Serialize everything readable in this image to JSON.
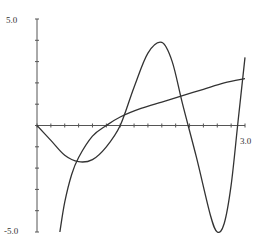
{
  "chart_data": {
    "type": "line",
    "title": "",
    "xlabel": "",
    "ylabel": "",
    "xlim": [
      0,
      3.0
    ],
    "ylim": [
      -5.0,
      5.0
    ],
    "x_tick_step": 0.2,
    "y_tick_step": 1.0,
    "axis_labels": {
      "y_max": "5.0",
      "y_min": "-5.0",
      "x_max": "3.0"
    },
    "grid": false,
    "legend": null,
    "series": [
      {
        "name": "log-curve",
        "x": [
          0.33,
          0.4,
          0.5,
          0.6,
          0.8,
          1.0,
          1.2,
          1.5,
          1.8,
          2.1,
          2.4,
          2.7,
          3.0
        ],
        "y": [
          -5.0,
          -3.6,
          -2.3,
          -1.5,
          -0.5,
          0.0,
          0.4,
          0.8,
          1.1,
          1.4,
          1.7,
          2.0,
          2.2
        ]
      },
      {
        "name": "oscillating-curve",
        "x": [
          0.0,
          0.2,
          0.4,
          0.6,
          0.8,
          1.0,
          1.2,
          1.4,
          1.6,
          1.8,
          1.95,
          2.1,
          2.3,
          2.5,
          2.6,
          2.7,
          2.8,
          2.9,
          3.0
        ],
        "y": [
          0.0,
          -0.7,
          -1.4,
          -1.7,
          -1.6,
          -1.0,
          0.0,
          1.8,
          3.4,
          3.9,
          3.0,
          1.0,
          -1.5,
          -4.2,
          -5.0,
          -4.6,
          -2.8,
          0.2,
          3.2
        ]
      }
    ]
  }
}
